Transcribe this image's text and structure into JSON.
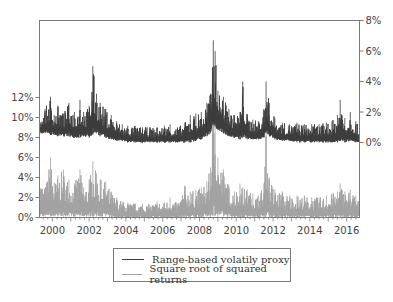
{
  "chart_data": {
    "type": "line",
    "title": "",
    "xlabel": "",
    "x_tick_labels": [
      "2000",
      "2002",
      "2004",
      "2006",
      "2008",
      "2010",
      "2012",
      "2014",
      "2016"
    ],
    "x_range": [
      1999.3,
      2016.7
    ],
    "left_axis": {
      "tick_labels": [
        "0%",
        "2%",
        "4%",
        "6%",
        "8%",
        "10%",
        "12%"
      ],
      "range_percent": [
        0,
        12
      ],
      "series": "Square root of squared returns"
    },
    "right_axis": {
      "tick_labels": [
        "0%",
        "2%",
        "4%",
        "6%",
        "8%"
      ],
      "range_percent": [
        0,
        8
      ],
      "series": "Range-based volatily proxy"
    },
    "grid": false,
    "legend_position": "bottom-center",
    "series": [
      {
        "name": "Range-based volatily proxy",
        "axis": "right",
        "color": "#3c3c3c",
        "x": [
          1999.3,
          1999.6,
          1999.9,
          2000.1,
          2000.3,
          2000.6,
          2000.9,
          2001.2,
          2001.5,
          2001.7,
          2002.0,
          2002.2,
          2002.4,
          2002.6,
          2002.9,
          2003.2,
          2003.5,
          2003.8,
          2004.1,
          2004.5,
          2004.9,
          2005.3,
          2005.7,
          2006.1,
          2006.4,
          2006.8,
          2007.2,
          2007.5,
          2007.8,
          2008.1,
          2008.4,
          2008.6,
          2008.75,
          2008.85,
          2009.0,
          2009.3,
          2009.6,
          2009.9,
          2010.2,
          2010.35,
          2010.6,
          2010.9,
          2011.2,
          2011.5,
          2011.62,
          2011.8,
          2012.1,
          2012.5,
          2012.9,
          2013.3,
          2013.7,
          2014.1,
          2014.5,
          2014.9,
          2015.2,
          2015.5,
          2015.65,
          2015.9,
          2016.2,
          2016.5,
          2016.7
        ],
        "values_peak": [
          1.6,
          2.2,
          3.0,
          1.8,
          2.4,
          1.9,
          2.6,
          2.0,
          2.8,
          2.0,
          2.4,
          5.0,
          3.2,
          2.6,
          2.2,
          1.8,
          1.4,
          1.2,
          1.1,
          1.1,
          1.0,
          1.0,
          1.0,
          1.1,
          1.2,
          1.0,
          1.3,
          1.8,
          1.9,
          2.0,
          2.6,
          3.2,
          6.7,
          6.0,
          3.4,
          3.0,
          2.2,
          1.8,
          2.0,
          4.0,
          1.8,
          1.5,
          1.4,
          2.2,
          4.0,
          2.6,
          1.6,
          1.3,
          1.2,
          1.3,
          1.2,
          1.2,
          1.2,
          1.3,
          1.4,
          1.8,
          2.8,
          1.6,
          2.0,
          1.4,
          1.0
        ],
        "values_base": [
          0.6,
          0.6,
          0.5,
          0.5,
          0.4,
          0.4,
          0.4,
          0.3,
          0.3,
          0.4,
          0.3,
          0.5,
          0.6,
          0.4,
          0.3,
          0.2,
          0.1,
          0.1,
          0.0,
          0.0,
          0.0,
          0.0,
          0.0,
          0.0,
          0.0,
          0.0,
          0.0,
          0.0,
          0.1,
          0.2,
          0.4,
          0.6,
          1.2,
          1.0,
          0.8,
          0.6,
          0.4,
          0.3,
          0.2,
          0.3,
          0.2,
          0.2,
          0.2,
          0.3,
          0.6,
          0.4,
          0.2,
          0.1,
          0.1,
          0.0,
          0.0,
          0.0,
          0.0,
          0.0,
          0.0,
          0.0,
          0.1,
          0.0,
          0.1,
          0.0,
          0.0
        ]
      },
      {
        "name": "Square root of squared returns",
        "axis": "left",
        "color": "#a2a2a2",
        "x": [
          1999.3,
          1999.6,
          1999.9,
          2000.1,
          2000.3,
          2000.6,
          2000.9,
          2001.2,
          2001.5,
          2001.7,
          2002.0,
          2002.2,
          2002.4,
          2002.6,
          2002.9,
          2003.2,
          2003.5,
          2003.8,
          2004.1,
          2004.5,
          2004.9,
          2005.3,
          2005.7,
          2006.1,
          2006.4,
          2006.8,
          2007.2,
          2007.5,
          2007.8,
          2008.1,
          2008.4,
          2008.6,
          2008.75,
          2008.85,
          2009.0,
          2009.3,
          2009.6,
          2009.9,
          2010.2,
          2010.35,
          2010.6,
          2010.9,
          2011.2,
          2011.5,
          2011.62,
          2011.8,
          2012.1,
          2012.5,
          2012.9,
          2013.3,
          2013.7,
          2014.1,
          2014.5,
          2014.9,
          2015.2,
          2015.5,
          2015.65,
          2015.9,
          2016.2,
          2016.5,
          2016.7
        ],
        "values_peak": [
          4.2,
          3.0,
          6.0,
          3.5,
          4.2,
          4.8,
          3.8,
          3.4,
          4.8,
          3.0,
          3.8,
          5.6,
          4.4,
          3.8,
          3.6,
          2.6,
          2.0,
          1.6,
          1.5,
          1.4,
          1.4,
          1.3,
          1.6,
          1.5,
          2.0,
          1.4,
          3.2,
          2.6,
          2.8,
          3.0,
          3.6,
          5.0,
          12.5,
          12.0,
          6.0,
          4.8,
          3.2,
          2.6,
          3.4,
          3.0,
          2.8,
          2.4,
          2.2,
          3.4,
          8.5,
          4.0,
          2.8,
          2.6,
          2.2,
          2.2,
          2.2,
          2.0,
          2.0,
          2.2,
          2.4,
          2.6,
          3.4,
          2.6,
          2.8,
          2.2,
          1.6
        ],
        "values_base": [
          0.1,
          0.1,
          0.1,
          0.1,
          0.1,
          0.1,
          0.1,
          0.1,
          0.1,
          0.1,
          0.1,
          0.1,
          0.1,
          0.1,
          0.1,
          0.0,
          0.0,
          0.0,
          0.0,
          0.0,
          0.0,
          0.0,
          0.0,
          0.0,
          0.0,
          0.0,
          0.0,
          0.0,
          0.0,
          0.0,
          0.1,
          0.1,
          0.2,
          0.2,
          0.1,
          0.1,
          0.1,
          0.0,
          0.0,
          0.0,
          0.0,
          0.0,
          0.0,
          0.0,
          0.1,
          0.0,
          0.0,
          0.0,
          0.0,
          0.0,
          0.0,
          0.0,
          0.0,
          0.0,
          0.0,
          0.0,
          0.0,
          0.0,
          0.0,
          0.0,
          0.0
        ]
      }
    ]
  },
  "legend": {
    "items": [
      {
        "label": "Range-based volatily proxy",
        "color": "#3c3c3c"
      },
      {
        "label": "Square root of squared returns",
        "color": "#a2a2a2"
      }
    ]
  }
}
